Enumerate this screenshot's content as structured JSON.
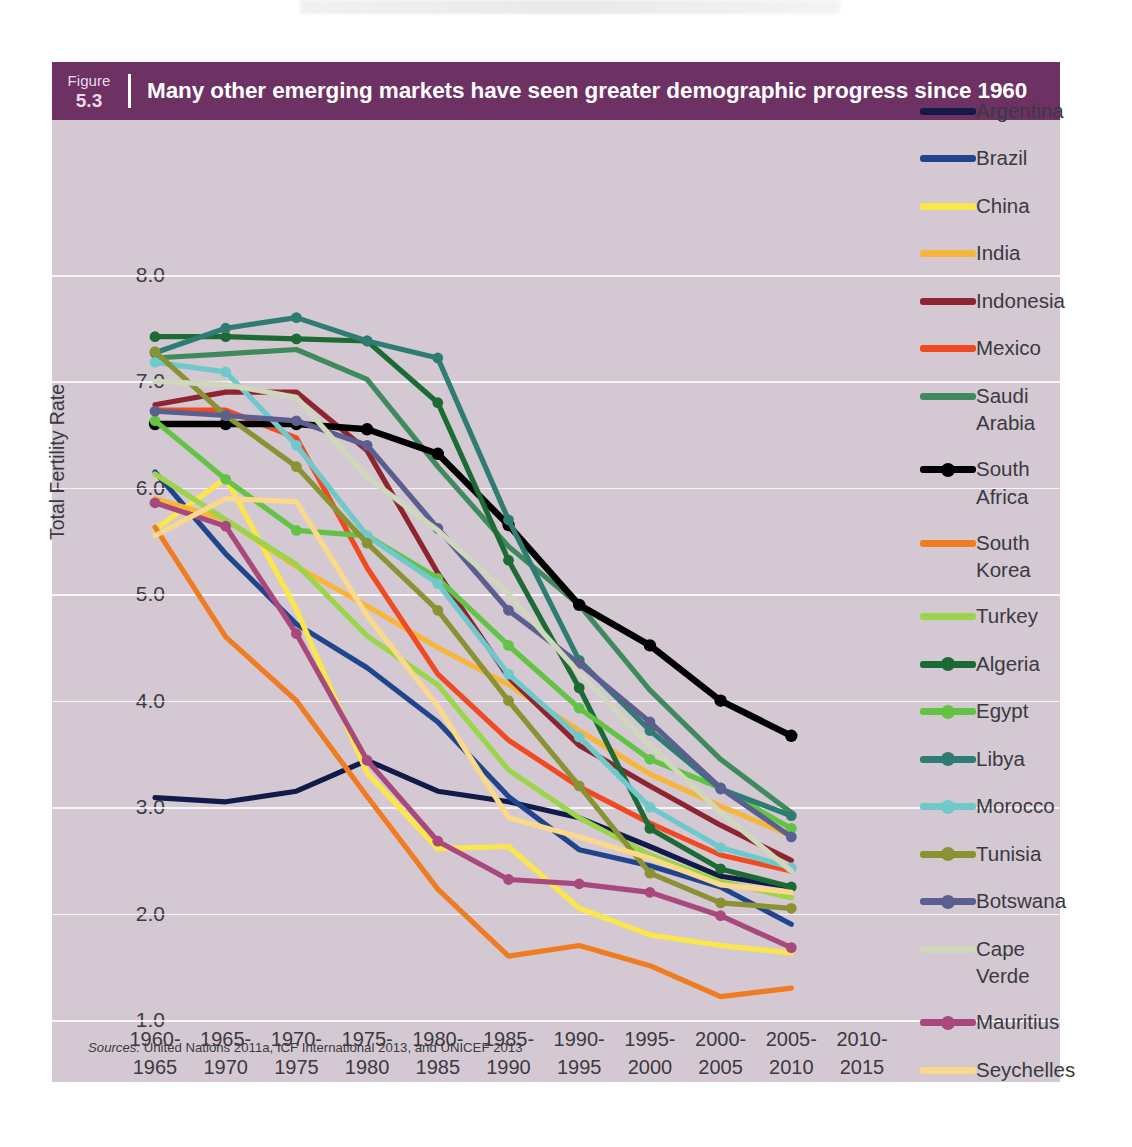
{
  "figure": {
    "label": "Figure",
    "number": "5.3",
    "title": "Many other emerging markets have seen greater demographic progress since 1960",
    "header_bg": "#6d3163",
    "card_bg": "#d4c9d3"
  },
  "sources": {
    "prefix": "Sources:",
    "text": " United Nations 2011a, ICF International 2013, and UNICEF 2013"
  },
  "chart_data": {
    "type": "line",
    "title": "Many other emerging markets have seen greater demographic progress since 1960",
    "xlabel": "",
    "ylabel": "Total Fertility Rate",
    "ylim": [
      1.0,
      8.0
    ],
    "yticks": [
      "8.0",
      "7.0",
      "6.0",
      "5.0",
      "4.0",
      "3.0",
      "2.0",
      "1.0"
    ],
    "ytick_values": [
      8.0,
      7.0,
      6.0,
      5.0,
      4.0,
      3.0,
      2.0,
      1.0
    ],
    "grid": "horizontal",
    "legend_position": "right",
    "categories": [
      "1960-1965",
      "1965-1970",
      "1970-1975",
      "1975-1980",
      "1980-1985",
      "1985-1990",
      "1990-1995",
      "1995-2000",
      "2000-2005",
      "2005-2010",
      "2010-2015"
    ],
    "categories_top": [
      "1960-",
      "1965-",
      "1970-",
      "1975-",
      "1980-",
      "1985-",
      "1990-",
      "1995-",
      "2000-",
      "2005-",
      "2010-"
    ],
    "categories_bottom": [
      "1965",
      "1970",
      "1975",
      "1980",
      "1985",
      "1990",
      "1995",
      "2000",
      "2005",
      "2010",
      "2015"
    ],
    "series": [
      {
        "name": "Argentina",
        "color": "#121a4a",
        "marker": false,
        "values": [
          3.09,
          3.05,
          3.15,
          3.44,
          3.15,
          3.05,
          2.9,
          2.63,
          2.35,
          2.25,
          null
        ]
      },
      {
        "name": "Brazil",
        "color": "#21458c",
        "marker": false,
        "values": [
          6.15,
          5.38,
          4.72,
          4.31,
          3.8,
          3.1,
          2.6,
          2.45,
          2.25,
          1.9,
          null
        ]
      },
      {
        "name": "China",
        "color": "#fbe64b",
        "marker": false,
        "values": [
          5.61,
          6.09,
          4.86,
          3.32,
          2.61,
          2.63,
          2.05,
          1.8,
          1.7,
          1.63,
          null
        ]
      },
      {
        "name": "India",
        "color": "#f7b53a",
        "marker": false,
        "values": [
          5.9,
          5.7,
          5.26,
          4.89,
          4.5,
          4.15,
          3.72,
          3.31,
          3.01,
          2.73,
          null
        ]
      },
      {
        "name": "Indonesia",
        "color": "#8e2430",
        "marker": false,
        "values": [
          6.78,
          6.9,
          6.9,
          6.35,
          5.2,
          4.22,
          3.58,
          3.2,
          2.83,
          2.5,
          null
        ]
      },
      {
        "name": "Mexico",
        "color": "#f04a23",
        "marker": false,
        "values": [
          6.73,
          6.73,
          6.47,
          5.25,
          4.25,
          3.63,
          3.19,
          2.85,
          2.55,
          2.4,
          null
        ]
      },
      {
        "name": "Saudi Arabia",
        "color": "#3f8a5d",
        "marker": false,
        "values": [
          7.22,
          7.26,
          7.3,
          7.02,
          6.2,
          5.45,
          4.9,
          4.1,
          3.45,
          2.95,
          null
        ]
      },
      {
        "name": "South Africa",
        "color": "#000000",
        "marker": true,
        "values": [
          6.6,
          6.6,
          6.6,
          6.55,
          6.32,
          5.65,
          4.9,
          4.52,
          4.0,
          3.67,
          null
        ]
      },
      {
        "name": "South Korea",
        "color": "#f07c22",
        "marker": false,
        "values": [
          5.63,
          4.6,
          4.0,
          3.1,
          2.23,
          1.6,
          1.7,
          1.51,
          1.22,
          1.3,
          null
        ]
      },
      {
        "name": "Turkey",
        "color": "#9ad54a",
        "marker": false,
        "values": [
          6.13,
          5.7,
          5.28,
          4.61,
          4.15,
          3.35,
          2.9,
          2.55,
          2.3,
          2.15,
          null
        ]
      },
      {
        "name": "Algeria",
        "color": "#1c6b34",
        "marker": true,
        "values": [
          7.42,
          7.42,
          7.4,
          7.38,
          6.8,
          5.32,
          4.12,
          2.8,
          2.42,
          2.25,
          null
        ]
      },
      {
        "name": "Egypt",
        "color": "#63c344",
        "marker": true,
        "values": [
          6.63,
          6.08,
          5.6,
          5.55,
          5.15,
          4.52,
          3.93,
          3.45,
          3.18,
          2.8,
          null
        ]
      },
      {
        "name": "Libya",
        "color": "#2f7d72",
        "marker": true,
        "values": [
          7.27,
          7.5,
          7.6,
          7.38,
          7.22,
          5.7,
          4.38,
          3.72,
          3.17,
          2.92,
          null
        ]
      },
      {
        "name": "Morocco",
        "color": "#6fc9cb",
        "marker": true,
        "values": [
          7.18,
          7.09,
          6.4,
          5.55,
          5.1,
          4.25,
          3.66,
          3.0,
          2.62,
          2.43,
          null
        ]
      },
      {
        "name": "Tunisia",
        "color": "#8a9234",
        "marker": true,
        "values": [
          7.28,
          6.68,
          6.2,
          5.48,
          4.85,
          4.0,
          3.2,
          2.38,
          2.1,
          2.05,
          null
        ]
      },
      {
        "name": "Botswana",
        "color": "#5a5f8f",
        "marker": true,
        "values": [
          6.72,
          6.68,
          6.63,
          6.4,
          5.62,
          4.85,
          4.35,
          3.8,
          3.18,
          2.72,
          null
        ]
      },
      {
        "name": "Cape Verde",
        "color": "#cfd8bb",
        "marker": false,
        "values": [
          7.0,
          6.97,
          6.85,
          6.1,
          5.6,
          5.0,
          4.26,
          3.58,
          2.95,
          2.4,
          null
        ]
      },
      {
        "name": "Mauritius",
        "color": "#a9487c",
        "marker": true,
        "values": [
          5.86,
          5.64,
          4.63,
          3.44,
          2.68,
          2.32,
          2.28,
          2.2,
          1.98,
          1.68,
          null
        ]
      },
      {
        "name": "Seychelles",
        "color": "#fbd98a",
        "marker": false,
        "values": [
          5.55,
          5.9,
          5.87,
          4.8,
          3.95,
          2.9,
          2.72,
          2.52,
          2.27,
          2.2,
          null
        ]
      }
    ],
    "legend_entries": [
      {
        "label": "Argentina",
        "color": "#121a4a",
        "marker": false
      },
      {
        "label": "Brazil",
        "color": "#21458c",
        "marker": false
      },
      {
        "label": "China",
        "color": "#fbe64b",
        "marker": false
      },
      {
        "label": "India",
        "color": "#f7b53a",
        "marker": false
      },
      {
        "label": "Indonesia",
        "color": "#8e2430",
        "marker": false
      },
      {
        "label": "Mexico",
        "color": "#f04a23",
        "marker": false
      },
      {
        "label": "Saudi Arabia",
        "color": "#3f8a5d",
        "marker": false,
        "line2": "Arabia",
        "line1": "Saudi"
      },
      {
        "label": "South Africa",
        "color": "#000000",
        "marker": true,
        "line2": "Africa",
        "line1": "South"
      },
      {
        "label": "South Korea",
        "color": "#f07c22",
        "marker": false,
        "line2": "Korea",
        "line1": "South"
      },
      {
        "label": "Turkey",
        "color": "#9ad54a",
        "marker": false
      },
      {
        "label": "Algeria",
        "color": "#1c6b34",
        "marker": true
      },
      {
        "label": "Egypt",
        "color": "#63c344",
        "marker": true
      },
      {
        "label": "Libya",
        "color": "#2f7d72",
        "marker": true
      },
      {
        "label": "Morocco",
        "color": "#6fc9cb",
        "marker": true
      },
      {
        "label": "Tunisia",
        "color": "#8a9234",
        "marker": true
      },
      {
        "label": "Botswana",
        "color": "#5a5f8f",
        "marker": true
      },
      {
        "label": "Cape Verde",
        "color": "#cfd8bb",
        "marker": false,
        "line2": "Verde",
        "line1": "Cape"
      },
      {
        "label": "Mauritius",
        "color": "#a9487c",
        "marker": true
      },
      {
        "label": "Seychelles",
        "color": "#fbd98a",
        "marker": false
      }
    ]
  }
}
